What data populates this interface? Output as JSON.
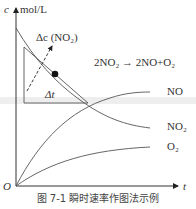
{
  "diagram": {
    "axis_y_label": "c",
    "axis_y_unit": "mol/L",
    "axis_x_label": "t",
    "origin_label": "O",
    "equation": "2NO₂ → 2NO+O₂",
    "delta_c_label": "Δc (NO₂)",
    "delta_t_label": "Δt",
    "curves": [
      {
        "name": "NO",
        "label": "NO"
      },
      {
        "name": "NO2",
        "label": "NO₂"
      },
      {
        "name": "O2",
        "label": "O₂"
      }
    ],
    "caption": "图 7-1   瞬时速率作图法示例"
  }
}
